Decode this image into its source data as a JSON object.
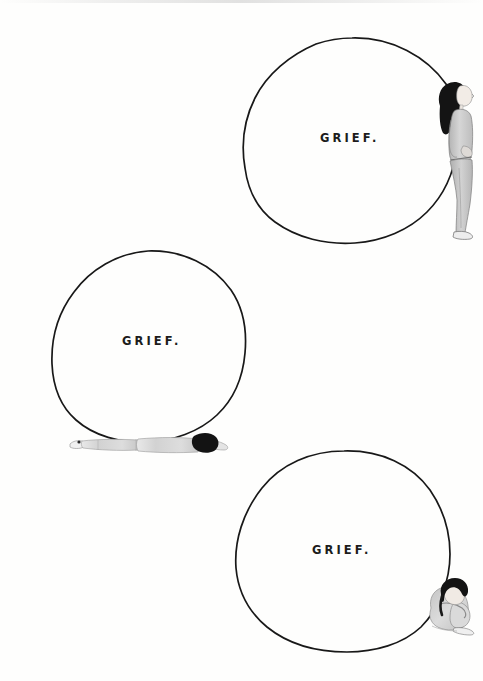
{
  "artwork": {
    "title": "Grief",
    "medium": "hand-drawn ink and watercolor illustration",
    "background_color": "#fefefd",
    "ink_color": "#181818",
    "width": 483,
    "height": 681
  },
  "panels": [
    {
      "id": "panel-top",
      "label": "GRIEF.",
      "label_x": 320,
      "label_y": 131,
      "circle": {
        "cx": 352,
        "cy": 141,
        "rx": 107,
        "ry": 103
      },
      "figure": {
        "name": "standing-leaning-figure",
        "pose": "standing, leaning back against the circle, head tilted up, arms behind back",
        "x": 432,
        "y": 76,
        "width": 42,
        "height": 165,
        "hair_color": "#1a1a1a",
        "clothing_color": "#c9c9c9",
        "skin_color": "#f0eae4"
      }
    },
    {
      "id": "panel-middle",
      "label": "GRIEF.",
      "label_x": 122,
      "label_y": 334,
      "circle": {
        "cx": 149,
        "cy": 348,
        "rx": 97,
        "ry": 96
      },
      "figure": {
        "name": "lying-prone-figure",
        "pose": "lying face-down on the ground beneath the circle, head to the right",
        "x": 68,
        "y": 432,
        "width": 162,
        "height": 26,
        "hair_color": "#1a1a1a",
        "clothing_color": "#dcdcdc",
        "skin_color": "#f0eae4"
      }
    },
    {
      "id": "panel-bottom",
      "label": "GRIEF.",
      "label_x": 312,
      "label_y": 543,
      "circle": {
        "cx": 344,
        "cy": 551,
        "rx": 107,
        "ry": 101
      },
      "figure": {
        "name": "seated-hugging-knees-figure",
        "pose": "sitting on the ground hugging knees, head bowed onto arms",
        "x": 424,
        "y": 572,
        "width": 49,
        "height": 62,
        "hair_color": "#1a1a1a",
        "clothing_color": "#d4d4d4",
        "skin_color": "#f0eae4"
      }
    }
  ]
}
